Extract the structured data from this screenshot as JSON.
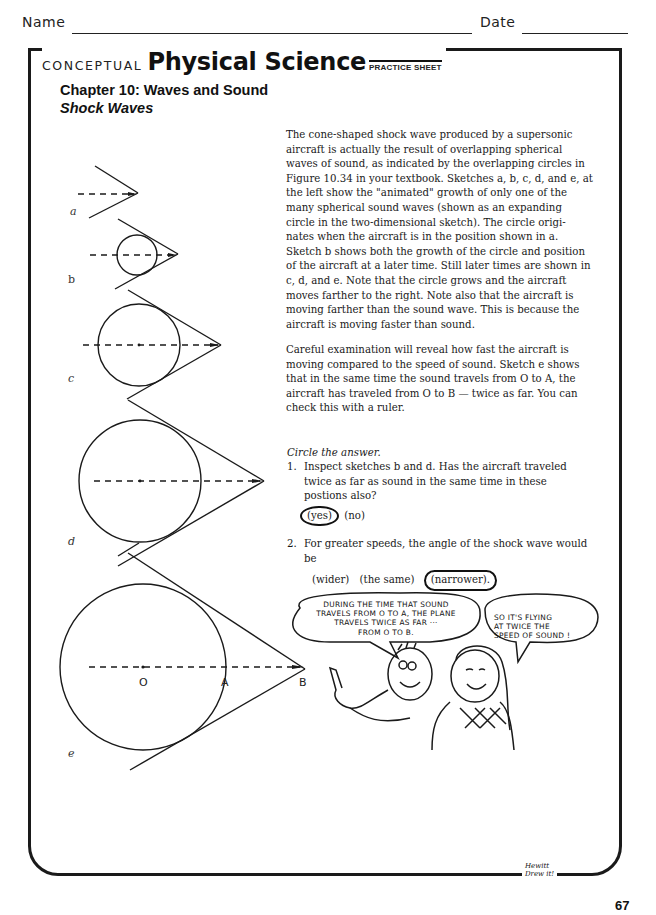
{
  "header": {
    "name_label": "Name",
    "date_label": "Date"
  },
  "brand": {
    "prefix": "CONCEPTUAL",
    "title": "Physical Science",
    "tag": "PRACTICE SHEET"
  },
  "chapter": {
    "title": "Chapter 10:  Waves and Sound",
    "subtitle": "Shock Waves"
  },
  "intro_paragraph": [
    "The cone-shaped shock wave produced by a supersonic",
    "aircraft is actually the result of overlapping spherical",
    "waves of sound, as indicated by the overlapping circles in",
    "Figure 10.34 in your textbook. Sketches a, b, c, d, and e, at",
    "the left show the \"animated\" growth of only one of the",
    "many spherical sound waves (shown as an expanding",
    "circle in the two-dimensional sketch). The circle origi-",
    "nates when the aircraft is in the position shown in a.",
    "Sketch b shows both the growth of the circle and position",
    "of the aircraft at a later time. Still later times are shown in",
    "c, d, and e. Note that the circle grows and the aircraft",
    "moves farther to the right. Note also that the aircraft is",
    "moving farther than the sound wave. This is because the",
    "aircraft is moving faster than sound."
  ],
  "second_paragraph": [
    "Careful examination will reveal how fast the aircraft is",
    "moving compared to the speed of sound. Sketch e shows",
    "that in the same time the sound travels from O to A, the",
    "aircraft has traveled from O to B — twice as far. You can",
    "check this with a ruler."
  ],
  "instructions": "Circle the answer.",
  "questions": [
    {
      "number": "1.",
      "lines": [
        "Inspect sketches b and d. Has the aircraft traveled",
        "twice as far as sound in the same time in these",
        "postions also?"
      ],
      "options": [
        "(yes)",
        "(no)"
      ],
      "selected": "(yes)"
    },
    {
      "number": "2.",
      "lines": [
        "For greater speeds, the angle of the shock wave would",
        "be"
      ],
      "options": [
        "(wider)",
        "(the same)",
        "(narrower)."
      ],
      "selected": "(narrower)."
    }
  ],
  "sketches": {
    "labels": [
      "a",
      "b",
      "c",
      "d",
      "e"
    ],
    "points": {
      "origin": "O",
      "sound": "A",
      "aircraft": "B"
    }
  },
  "cartoon": {
    "boy_speech": [
      "DURING THE TIME THAT SOUND",
      "TRAVELS FROM O TO A, THE PLANE",
      "TRAVELS TWICE AS FAR ···",
      "FROM O TO B."
    ],
    "girl_speech": [
      "SO IT'S FLYING",
      "AT TWICE THE",
      "SPEED OF SOUND !"
    ]
  },
  "footer": {
    "signature": [
      "Hewitt",
      "Drew it!"
    ],
    "page_number": "67"
  }
}
